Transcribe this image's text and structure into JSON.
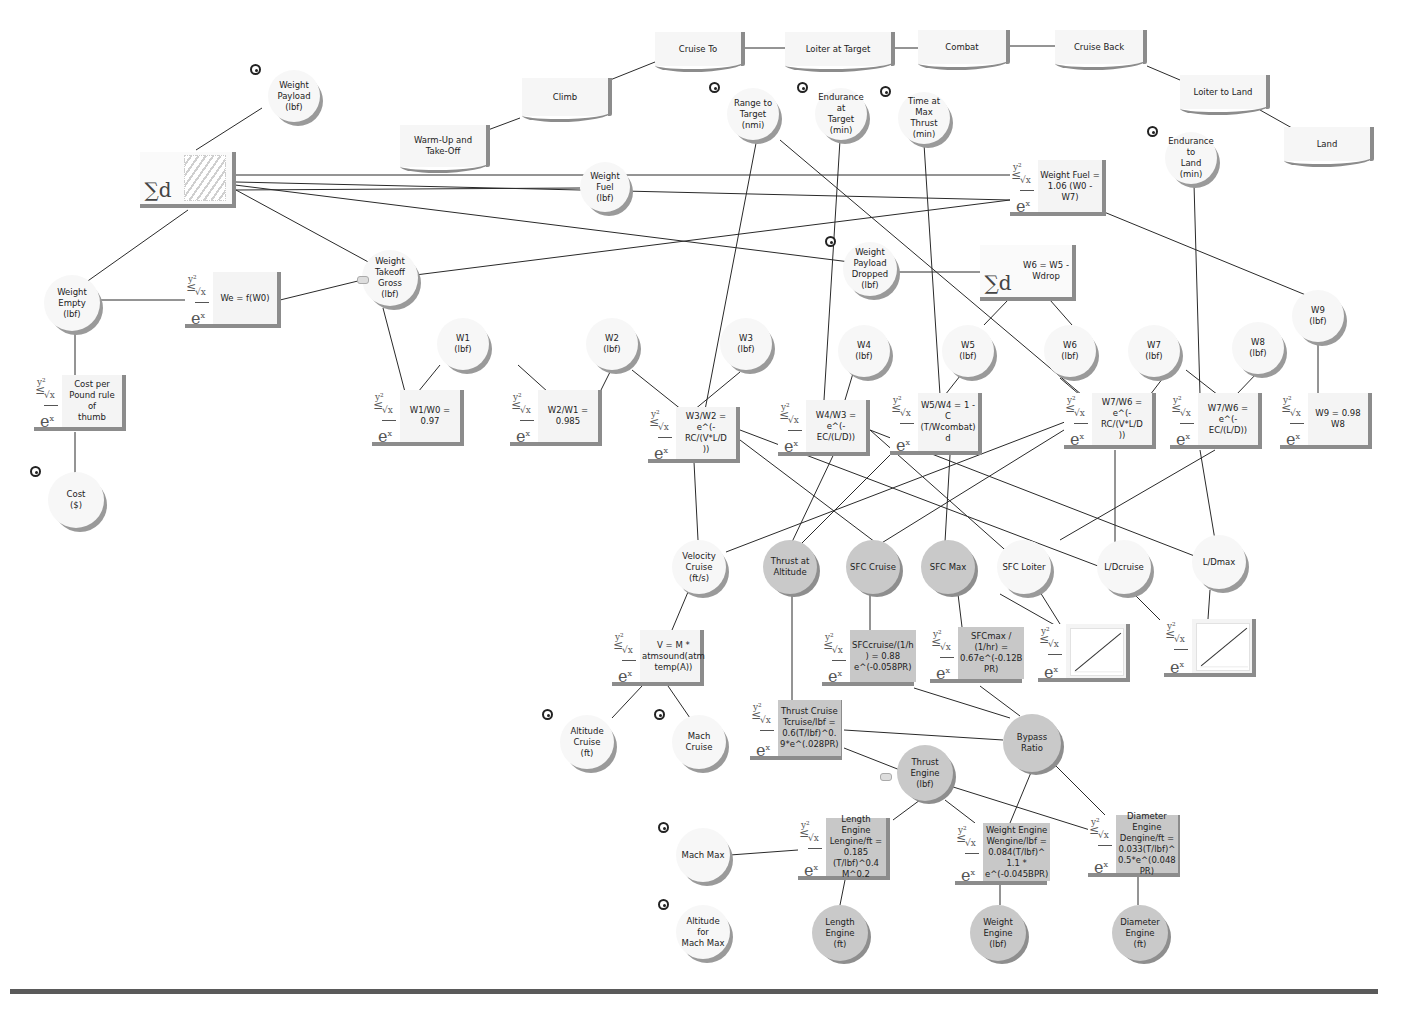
{
  "diagram": {
    "type": "influence-diagram",
    "mission_phases": [
      {
        "id": "warmup",
        "label": "Warm-Up and\nTake-Off",
        "x": 400,
        "y": 125,
        "w": 90,
        "h": 42
      },
      {
        "id": "climb",
        "label": "Climb",
        "x": 522,
        "y": 78,
        "w": 90,
        "h": 38
      },
      {
        "id": "cruise_to",
        "label": "Cruise To",
        "x": 655,
        "y": 32,
        "w": 90,
        "h": 34
      },
      {
        "id": "loiter_target",
        "label": "Loiter at Target",
        "x": 785,
        "y": 32,
        "w": 110,
        "h": 34
      },
      {
        "id": "combat",
        "label": "Combat",
        "x": 918,
        "y": 30,
        "w": 92,
        "h": 34
      },
      {
        "id": "cruise_back",
        "label": "Cruise Back",
        "x": 1055,
        "y": 30,
        "w": 92,
        "h": 34
      },
      {
        "id": "loiter_land",
        "label": "Loiter to Land",
        "x": 1180,
        "y": 75,
        "w": 90,
        "h": 34
      },
      {
        "id": "land",
        "label": "Land",
        "x": 1284,
        "y": 127,
        "w": 90,
        "h": 34
      }
    ],
    "variables": [
      {
        "id": "weight_payload",
        "label": "Weight\nPayload\n(lbf)",
        "x": 268,
        "y": 70,
        "d": 52,
        "grey": false,
        "input": true
      },
      {
        "id": "range_target",
        "label": "Range to\nTarget\n(nmi)",
        "x": 727,
        "y": 88,
        "d": 52,
        "grey": false,
        "input": true
      },
      {
        "id": "endurance_target",
        "label": "Endurance at\nTarget\n(min)",
        "x": 815,
        "y": 88,
        "d": 52,
        "grey": false,
        "input": true
      },
      {
        "id": "time_max_thrust",
        "label": "Time at Max\nThrust\n(min)",
        "x": 898,
        "y": 92,
        "d": 52,
        "grey": false,
        "input": true
      },
      {
        "id": "endurance_land",
        "label": "Endurance to\nLand\n(min)",
        "x": 1165,
        "y": 132,
        "d": 52,
        "grey": false,
        "input": true
      },
      {
        "id": "weight_fuel",
        "label": "Weight Fuel\n(lbf)",
        "x": 580,
        "y": 162,
        "d": 50,
        "grey": false,
        "input": false
      },
      {
        "id": "weight_empty",
        "label": "Weight Empty\n(lbf)",
        "x": 44,
        "y": 275,
        "d": 56,
        "grey": false,
        "input": false
      },
      {
        "id": "weight_takeoff_gross",
        "label": "Weight\nTakeoff Gross\n(lbf)",
        "x": 362,
        "y": 250,
        "d": 56,
        "grey": false,
        "input": false
      },
      {
        "id": "weight_payload_dropped",
        "label": "Weight\nPayload\nDropped\n(lbf)",
        "x": 843,
        "y": 242,
        "d": 54,
        "grey": false,
        "input": true
      },
      {
        "id": "w1",
        "label": "W1\n(lbf)",
        "x": 437,
        "y": 318,
        "d": 52,
        "grey": false,
        "input": false
      },
      {
        "id": "w2",
        "label": "W2\n(lbf)",
        "x": 586,
        "y": 318,
        "d": 52,
        "grey": false,
        "input": false
      },
      {
        "id": "w3",
        "label": "W3\n(lbf)",
        "x": 720,
        "y": 318,
        "d": 52,
        "grey": false,
        "input": false
      },
      {
        "id": "w4",
        "label": "W4\n(lbf)",
        "x": 838,
        "y": 325,
        "d": 52,
        "grey": false,
        "input": false
      },
      {
        "id": "w5",
        "label": "W5\n(lbf)",
        "x": 942,
        "y": 325,
        "d": 52,
        "grey": false,
        "input": false
      },
      {
        "id": "w6",
        "label": "W6\n(lbf)",
        "x": 1044,
        "y": 325,
        "d": 52,
        "grey": false,
        "input": false
      },
      {
        "id": "w7",
        "label": "W7\n(lbf)",
        "x": 1128,
        "y": 325,
        "d": 52,
        "grey": false,
        "input": false
      },
      {
        "id": "w8",
        "label": "W8\n(lbf)",
        "x": 1232,
        "y": 322,
        "d": 52,
        "grey": false,
        "input": false
      },
      {
        "id": "w9",
        "label": "W9\n(lbf)",
        "x": 1292,
        "y": 290,
        "d": 52,
        "grey": false,
        "input": false
      },
      {
        "id": "cost",
        "label": "Cost\n($)",
        "x": 48,
        "y": 472,
        "d": 56,
        "grey": false,
        "input": true
      },
      {
        "id": "velocity_cruise",
        "label": "Velocity\nCruise\n(ft/s)",
        "x": 672,
        "y": 540,
        "d": 54,
        "grey": false,
        "input": false
      },
      {
        "id": "thrust_altitude",
        "label": "Thrust at\nAltitude",
        "x": 763,
        "y": 540,
        "d": 54,
        "grey": true,
        "input": false
      },
      {
        "id": "sfc_cruise",
        "label": "SFC Cruise",
        "x": 846,
        "y": 540,
        "d": 54,
        "grey": true,
        "input": false
      },
      {
        "id": "sfc_max",
        "label": "SFC Max",
        "x": 921,
        "y": 540,
        "d": 54,
        "grey": true,
        "input": false
      },
      {
        "id": "sfc_loiter",
        "label": "SFC Loiter",
        "x": 997,
        "y": 540,
        "d": 54,
        "grey": false,
        "input": false
      },
      {
        "id": "ld_cruise",
        "label": "L/Dcruise",
        "x": 1097,
        "y": 540,
        "d": 54,
        "grey": false,
        "input": false
      },
      {
        "id": "ld_max",
        "label": "L/Dmax",
        "x": 1192,
        "y": 535,
        "d": 54,
        "grey": false,
        "input": false
      },
      {
        "id": "altitude_cruise",
        "label": "Altitude Cruise\n(ft)",
        "x": 560,
        "y": 715,
        "d": 54,
        "grey": false,
        "input": true
      },
      {
        "id": "mach_cruise",
        "label": "Mach Cruise",
        "x": 672,
        "y": 715,
        "d": 54,
        "grey": false,
        "input": true
      },
      {
        "id": "bypass_ratio",
        "label": "Bypass  Ratio",
        "x": 1003,
        "y": 714,
        "d": 58,
        "grey": true,
        "input": false
      },
      {
        "id": "thrust_engine",
        "label": "Thrust Engine\n(lbf)",
        "x": 897,
        "y": 745,
        "d": 56,
        "grey": true,
        "input": false
      },
      {
        "id": "mach_max",
        "label": "Mach Max",
        "x": 676,
        "y": 828,
        "d": 54,
        "grey": false,
        "input": true
      },
      {
        "id": "altitude_mach_max",
        "label": "Altitude for\nMach Max",
        "x": 676,
        "y": 905,
        "d": 54,
        "grey": false,
        "input": true
      },
      {
        "id": "length_engine",
        "label": "Length Engine\n(ft)",
        "x": 812,
        "y": 905,
        "d": 56,
        "grey": true,
        "input": false
      },
      {
        "id": "weight_engine",
        "label": "Weight\nEngine\n(lbf)",
        "x": 970,
        "y": 905,
        "d": 56,
        "grey": true,
        "input": false
      },
      {
        "id": "diameter_engine",
        "label": "Diameter\nEngine\n(ft)",
        "x": 1112,
        "y": 905,
        "d": 56,
        "grey": true,
        "input": false
      }
    ],
    "functions": [
      {
        "id": "sum_w0",
        "label": "",
        "kind": "sum",
        "x": 140,
        "y": 152,
        "w": 96,
        "h": 56,
        "grey": false
      },
      {
        "id": "weight_fuel_eq",
        "label": "Weight Fuel =\n1.06 (W0 -\nW7)",
        "x": 1010,
        "y": 160,
        "w": 96,
        "h": 56,
        "grey": false
      },
      {
        "id": "we_eq",
        "label": "We = f(W0)",
        "x": 185,
        "y": 272,
        "w": 96,
        "h": 56,
        "grey": false
      },
      {
        "id": "w6_eq",
        "label": "W6 = W5 -\nWdrop",
        "kind": "sum",
        "x": 980,
        "y": 245,
        "w": 96,
        "h": 56,
        "grey": false
      },
      {
        "id": "cost_eq",
        "label": "Cost per\nPound rule of\nthumb",
        "x": 34,
        "y": 375,
        "w": 92,
        "h": 56,
        "grey": false
      },
      {
        "id": "w1w0_eq",
        "label": "W1/W0 =\n0.97",
        "x": 372,
        "y": 390,
        "w": 92,
        "h": 56,
        "grey": false
      },
      {
        "id": "w2w1_eq",
        "label": "W2/W1 =\n0.985",
        "x": 510,
        "y": 390,
        "w": 92,
        "h": 56,
        "grey": false
      },
      {
        "id": "w3w2_eq",
        "label": "W3/W2 =\ne^(-RC/(V*L/D\n))",
        "x": 648,
        "y": 407,
        "w": 92,
        "h": 56,
        "grey": false
      },
      {
        "id": "w4w3_eq",
        "label": "W4/W3 =\ne^(-EC/(L/D))",
        "x": 778,
        "y": 400,
        "w": 92,
        "h": 56,
        "grey": false
      },
      {
        "id": "w5w4_eq",
        "label": "W5/W4 = 1 -\nC\n(T/Wcombat)\nd",
        "x": 890,
        "y": 393,
        "w": 92,
        "h": 62,
        "grey": false
      },
      {
        "id": "w7w6_rc_eq",
        "label": "W7/W6 =\ne^(-RC/(V*L/D\n))",
        "x": 1064,
        "y": 393,
        "w": 92,
        "h": 56,
        "grey": false
      },
      {
        "id": "w7w6_ec_eq",
        "label": "W7/W6 =\ne^(-EC/(L/D))",
        "x": 1170,
        "y": 393,
        "w": 92,
        "h": 56,
        "grey": false
      },
      {
        "id": "w9_eq",
        "label": "W9 = 0.98\nW8",
        "x": 1280,
        "y": 393,
        "w": 92,
        "h": 56,
        "grey": false
      },
      {
        "id": "velocity_eq",
        "label": "V = M *\natmsound(atm\ntemp(A))",
        "x": 612,
        "y": 630,
        "w": 92,
        "h": 56,
        "grey": false
      },
      {
        "id": "sfc_cruise_eq",
        "label": "SFCcruise/(1/h\n) = 0.88\ne^(-0.058PR)",
        "x": 822,
        "y": 630,
        "w": 92,
        "h": 56,
        "grey": true
      },
      {
        "id": "sfc_max_eq",
        "label": "SFCmax /\n(1/hr) =\n0.67e^(-0.12B\nPR)",
        "x": 930,
        "y": 627,
        "w": 92,
        "h": 56,
        "grey": true
      },
      {
        "id": "sfc_loiter_chart",
        "label": "",
        "kind": "chart",
        "x": 1038,
        "y": 624,
        "w": 92,
        "h": 58,
        "grey": false
      },
      {
        "id": "ld_chart",
        "label": "",
        "kind": "chart",
        "x": 1164,
        "y": 619,
        "w": 92,
        "h": 58,
        "grey": false
      },
      {
        "id": "thrust_cruise_eq",
        "label": "Thrust Cruise\nTcruise/lbf =\n0.6(T/lbf)^0.\n9*e^(.028PR)",
        "x": 750,
        "y": 700,
        "w": 92,
        "h": 60,
        "grey": true
      },
      {
        "id": "length_engine_eq",
        "label": "Length Engine\nLengine/ft =\n0.185\n(T/lbf)^0.4\nM^0.2",
        "x": 798,
        "y": 818,
        "w": 92,
        "h": 62,
        "grey": true
      },
      {
        "id": "weight_engine_eq",
        "label": "Weight Engine\nWengine/lbf =\n0.084(T/lbf)^\n1.1 *\ne^(-0.045BPR)",
        "x": 955,
        "y": 823,
        "w": 92,
        "h": 62,
        "grey": true
      },
      {
        "id": "diameter_engine_eq",
        "label": "Diameter\nEngine\nDengine/ft =\n0.033(T/lbf)^\n0.5*e^(0.048\nPR)",
        "x": 1088,
        "y": 815,
        "w": 92,
        "h": 62,
        "grey": true
      }
    ],
    "edges": [
      [
        445,
        146,
        520,
        118
      ],
      [
        610,
        80,
        655,
        62
      ],
      [
        745,
        48,
        790,
        48
      ],
      [
        895,
        48,
        918,
        48
      ],
      [
        1010,
        46,
        1055,
        46
      ],
      [
        1147,
        66,
        1180,
        80
      ],
      [
        1260,
        110,
        1292,
        128
      ],
      [
        196,
        150,
        262,
        108
      ],
      [
        236,
        175,
        1010,
        175
      ],
      [
        236,
        182,
        1010,
        200
      ],
      [
        236,
        190,
        580,
        188
      ],
      [
        236,
        190,
        372,
        264
      ],
      [
        188,
        210,
        75,
        290
      ],
      [
        100,
        300,
        185,
        300
      ],
      [
        280,
        300,
        362,
        280
      ],
      [
        360,
        282,
        1010,
        200
      ],
      [
        235,
        185,
        850,
        262
      ],
      [
        75,
        330,
        75,
        375
      ],
      [
        75,
        432,
        75,
        474
      ],
      [
        383,
        308,
        405,
        392
      ],
      [
        440,
        365,
        418,
        392
      ],
      [
        518,
        365,
        548,
        392
      ],
      [
        612,
        368,
        600,
        392
      ],
      [
        632,
        370,
        682,
        410
      ],
      [
        740,
        372,
        694,
        410
      ],
      [
        757,
        138,
        705,
        410
      ],
      [
        780,
        140,
        1082,
        395
      ],
      [
        840,
        140,
        824,
        400
      ],
      [
        924,
        144,
        940,
        395
      ],
      [
        897,
        272,
        980,
        272
      ],
      [
        1008,
        300,
        984,
        325
      ],
      [
        1050,
        300,
        1072,
        325
      ],
      [
        1194,
        184,
        1200,
        395
      ],
      [
        1104,
        212,
        1318,
        300
      ],
      [
        854,
        370,
        845,
        400
      ],
      [
        960,
        376,
        945,
        395
      ],
      [
        1060,
        378,
        1080,
        395
      ],
      [
        1166,
        374,
        1150,
        395
      ],
      [
        1186,
        370,
        1218,
        395
      ],
      [
        1258,
        372,
        1236,
        395
      ],
      [
        1318,
        340,
        1318,
        395
      ],
      [
        694,
        462,
        698,
        540
      ],
      [
        740,
        440,
        875,
        542
      ],
      [
        740,
        430,
        1098,
        566
      ],
      [
        870,
        430,
        1210,
        562
      ],
      [
        870,
        430,
        1012,
        556
      ],
      [
        850,
        420,
        792,
        542
      ],
      [
        890,
        455,
        800,
        545
      ],
      [
        1064,
        430,
        880,
        544
      ],
      [
        1070,
        420,
        726,
        552
      ],
      [
        1115,
        450,
        1115,
        545
      ],
      [
        1200,
        450,
        1215,
        540
      ],
      [
        1215,
        450,
        1060,
        540
      ],
      [
        950,
        455,
        945,
        542
      ],
      [
        688,
        592,
        672,
        630
      ],
      [
        642,
        686,
        612,
        718
      ],
      [
        668,
        686,
        690,
        718
      ],
      [
        870,
        594,
        870,
        630
      ],
      [
        958,
        594,
        962,
        627
      ],
      [
        1000,
        594,
        1060,
        628
      ],
      [
        1130,
        590,
        1160,
        620
      ],
      [
        1210,
        590,
        1208,
        619
      ],
      [
        1040,
        592,
        1060,
        624
      ],
      [
        792,
        594,
        792,
        700
      ],
      [
        914,
        688,
        1010,
        718
      ],
      [
        980,
        686,
        1020,
        716
      ],
      [
        844,
        730,
        1003,
        740
      ],
      [
        844,
        748,
        900,
        770
      ],
      [
        920,
        800,
        893,
        820
      ],
      [
        945,
        800,
        975,
        823
      ],
      [
        1032,
        770,
        1010,
        823
      ],
      [
        1050,
        760,
        1105,
        815
      ],
      [
        950,
        786,
        1090,
        830
      ],
      [
        730,
        855,
        798,
        850
      ],
      [
        845,
        880,
        840,
        905
      ],
      [
        1000,
        885,
        1000,
        905
      ],
      [
        1138,
        877,
        1138,
        905
      ]
    ]
  },
  "caption": "Figure: Aircraft sizing influence diagram (mission phases, weight fractions and engine model)"
}
